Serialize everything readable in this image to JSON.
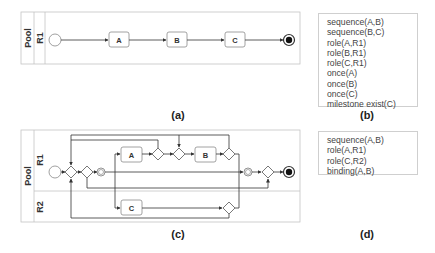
{
  "figure_a": {
    "caption": "(a)",
    "pool_label": "Pool",
    "lanes": [
      {
        "label": "R1"
      }
    ],
    "tasks": [
      {
        "label": "A"
      },
      {
        "label": "B"
      },
      {
        "label": "C"
      }
    ]
  },
  "figure_b": {
    "caption": "(b)",
    "constraints": [
      "sequence(A,B)",
      "sequence(B,C)",
      "role(A,R1)",
      "role(B,R1)",
      "role(C,R1)",
      "once(A)",
      "once(B)",
      "once(C)",
      "milestone exist(C)"
    ]
  },
  "figure_c": {
    "caption": "(c)",
    "pool_label": "Pool",
    "lanes": [
      {
        "label": "R1"
      },
      {
        "label": "R2"
      }
    ],
    "tasks": [
      {
        "label": "A"
      },
      {
        "label": "B"
      },
      {
        "label": "C"
      }
    ]
  },
  "figure_d": {
    "caption": "(d)",
    "constraints": [
      "sequence(A,B)",
      "role(A,R1)",
      "role(C,R2)",
      "binding(A,B)"
    ]
  },
  "colors": {
    "line": "#333333",
    "border": "#bdbdbd",
    "task_border": "#8a8a8a"
  }
}
